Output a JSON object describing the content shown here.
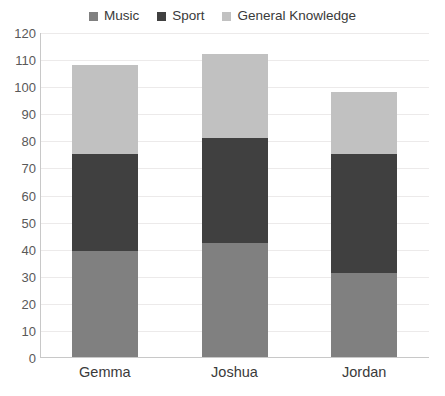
{
  "chart_data": {
    "type": "bar",
    "subtype": "stacked-bar-vertical",
    "title": "",
    "subtitle": "",
    "xlabel": "",
    "ylabel": "",
    "categories": [
      "Gemma",
      "Joshua",
      "Jordan"
    ],
    "series": [
      {
        "name": "Music",
        "color": "#808080",
        "values": [
          39,
          42,
          31
        ]
      },
      {
        "name": "Sport",
        "color": "#404040",
        "values": [
          36,
          39,
          44
        ]
      },
      {
        "name": "General Knowledge",
        "color": "#c1c1c1",
        "values": [
          33,
          31,
          23
        ]
      }
    ],
    "totals": [
      108,
      112,
      98
    ],
    "ylim": [
      0,
      120
    ],
    "ytick_step": 10,
    "yticks": [
      0,
      10,
      20,
      30,
      40,
      50,
      60,
      70,
      80,
      90,
      100,
      110,
      120
    ],
    "ytick_labels": [
      "0",
      "10",
      "20",
      "30",
      "40",
      "50",
      "60",
      "70",
      "80",
      "90",
      "100",
      "110",
      "120"
    ],
    "grid": true,
    "grid_axis": "y",
    "legend": true,
    "legend_position": "top",
    "axis_color": "#c8c8c8",
    "grid_color": "#eceaea",
    "background": "#ffffff",
    "text_color": "#3a3a3a",
    "stack_order_bottom_to_top": [
      "Music",
      "Sport",
      "General Knowledge"
    ],
    "segment_tops": {
      "Gemma": {
        "Music": 39,
        "Sport": 75,
        "General Knowledge": 108
      },
      "Joshua": {
        "Music": 42,
        "Sport": 81,
        "General Knowledge": 112
      },
      "Jordan": {
        "Music": 31,
        "Sport": 75,
        "General Knowledge": 98
      }
    }
  }
}
